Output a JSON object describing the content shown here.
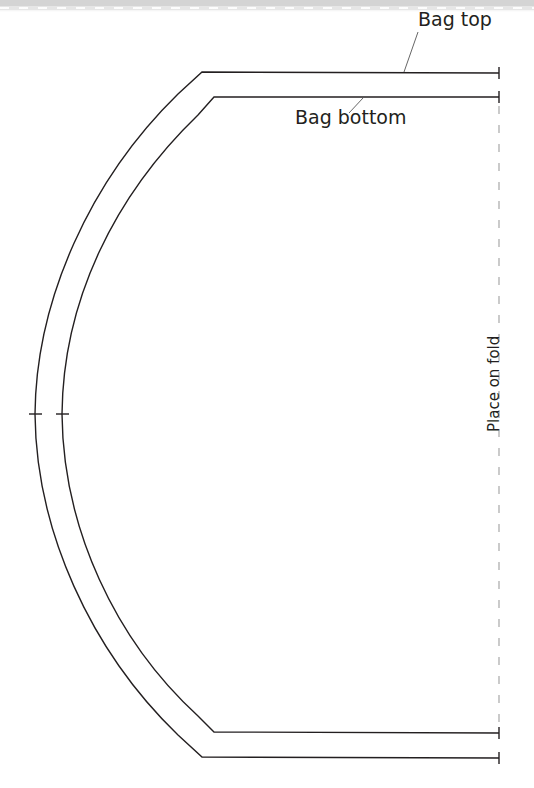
{
  "diagram": {
    "type": "sewing-pattern-piece",
    "labels": {
      "bag_top": "Bag top",
      "bag_bottom": "Bag bottom",
      "fold": "Place on fold"
    },
    "colors": {
      "line": "#231f20",
      "fold_line": "#a8a8a8",
      "background": "#ffffff",
      "top_band": "#d4d4d4"
    },
    "notches": 2
  }
}
